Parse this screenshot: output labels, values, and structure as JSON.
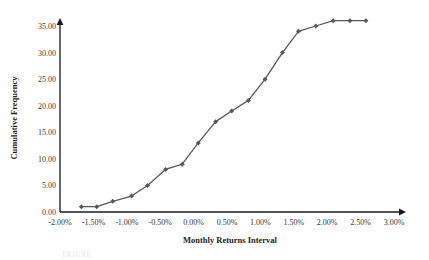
{
  "chart_data": {
    "type": "line",
    "title": "",
    "xlabel": "Monthly Returns Interval",
    "ylabel": "Cumulative Frequency",
    "xlim": [
      -2.0,
      3.0
    ],
    "ylim": [
      0.0,
      36.5
    ],
    "grid": false,
    "legend": "none",
    "series_color": "#595959",
    "axis_color": "#1a1a1a",
    "marker": "diamond",
    "xticks": [
      -2.0,
      -1.5,
      -1.0,
      -0.5,
      0.0,
      0.5,
      1.0,
      1.5,
      2.0,
      2.5,
      3.0
    ],
    "xtick_labels": [
      "-2.00%",
      "-1.50%",
      "-1.00%",
      "-0.50%",
      "0.00%",
      "0.50%",
      "1.00%",
      "1.50%",
      "2.00%",
      "2.50%",
      "3.00%"
    ],
    "yticks": [
      0.0,
      5.0,
      10.0,
      15.0,
      20.0,
      25.0,
      30.0,
      35.0
    ],
    "ytick_labels": [
      "0.00",
      "5.00",
      "10.00",
      "15.00",
      "20.00",
      "25.00",
      "30.00",
      "35.00"
    ],
    "series": [
      {
        "name": "Cumulative Frequency",
        "x": [
          -1.68,
          -1.45,
          -1.21,
          -0.93,
          -0.69,
          -0.42,
          -0.17,
          0.07,
          0.33,
          0.57,
          0.82,
          1.07,
          1.33,
          1.57,
          1.83,
          2.09,
          2.34,
          2.58
        ],
        "values": [
          1,
          1,
          2,
          3,
          5,
          8,
          9,
          13,
          17,
          19,
          21,
          25,
          30,
          34,
          35,
          36,
          36,
          36
        ]
      }
    ]
  },
  "caption": {
    "ghost_text": "FIGURE"
  }
}
